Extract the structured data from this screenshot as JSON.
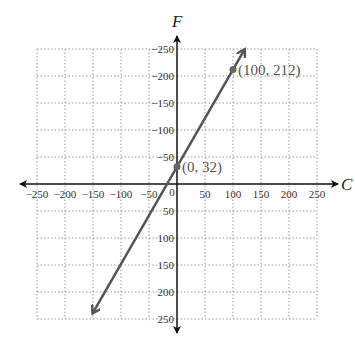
{
  "chart_data": {
    "type": "line",
    "title": "",
    "xlabel": "C",
    "ylabel": "F",
    "xlim": [
      -250,
      250
    ],
    "ylim": [
      -250,
      250
    ],
    "grid": true,
    "x_ticks": [
      -250,
      -200,
      -150,
      -100,
      -50,
      0,
      50,
      100,
      150,
      200,
      250
    ],
    "y_ticks": [
      -250,
      -200,
      -150,
      -100,
      -50,
      50,
      100,
      150,
      200,
      250
    ],
    "x_tick_labels": [
      "−250",
      "−200",
      "−150",
      "−100",
      "−50",
      "0",
      "50",
      "100",
      "150",
      "200",
      "250"
    ],
    "y_tick_labels": [
      "250",
      "200",
      "150",
      "100",
      "50",
      "−50",
      "−100",
      "−150",
      "−200",
      "−250"
    ],
    "series": [
      {
        "name": "F = 1.8C + 32",
        "color": "#555555",
        "line_from": [
          -150,
          -238
        ],
        "line_to": [
          120,
          248
        ],
        "arrows_both_ends": true
      }
    ],
    "points": [
      {
        "x": 0,
        "y": 32,
        "label": "(0, 32)"
      },
      {
        "x": 100,
        "y": 212,
        "label": "(100, 212)"
      }
    ]
  }
}
